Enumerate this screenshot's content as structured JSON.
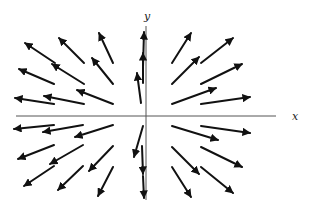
{
  "figure": {
    "title": "",
    "axes": {
      "x": {
        "label": "x",
        "from": [
          16,
          116
        ],
        "to": [
          276,
          116
        ],
        "label_pos": [
          292,
          120
        ],
        "color": "#555555"
      },
      "y": {
        "label": "y",
        "from": [
          146,
          200
        ],
        "to": [
          146,
          26
        ],
        "label_pos": [
          144,
          20
        ],
        "color": "#555555"
      }
    },
    "arrow_color": "#111111",
    "arrows": [
      {
        "tail": [
          55,
          63
        ],
        "head": [
          25,
          43
        ]
      },
      {
        "tail": [
          84,
          63
        ],
        "head": [
          59,
          38
        ]
      },
      {
        "tail": [
          113,
          63
        ],
        "head": [
          99,
          33
        ]
      },
      {
        "tail": [
          54,
          84
        ],
        "head": [
          19,
          69
        ]
      },
      {
        "tail": [
          84,
          84
        ],
        "head": [
          52,
          64
        ]
      },
      {
        "tail": [
          113,
          84
        ],
        "head": [
          92,
          58
        ]
      },
      {
        "tail": [
          54,
          104
        ],
        "head": [
          15,
          98
        ]
      },
      {
        "tail": [
          84,
          104
        ],
        "head": [
          44,
          96
        ]
      },
      {
        "tail": [
          113,
          104
        ],
        "head": [
          77,
          90
        ]
      },
      {
        "tail": [
          141,
          103
        ],
        "head": [
          137,
          73
        ]
      },
      {
        "tail": [
          143,
          83
        ],
        "head": [
          143,
          53
        ]
      },
      {
        "tail": [
          143,
          67
        ],
        "head": [
          144,
          32
        ]
      },
      {
        "tail": [
          172,
          63
        ],
        "head": [
          191,
          33
        ]
      },
      {
        "tail": [
          201,
          63
        ],
        "head": [
          233,
          38
        ]
      },
      {
        "tail": [
          172,
          84
        ],
        "head": [
          199,
          57
        ]
      },
      {
        "tail": [
          201,
          84
        ],
        "head": [
          242,
          64
        ]
      },
      {
        "tail": [
          172,
          104
        ],
        "head": [
          216,
          88
        ]
      },
      {
        "tail": [
          201,
          104
        ],
        "head": [
          250,
          97
        ]
      },
      {
        "tail": [
          54,
          125
        ],
        "head": [
          14,
          129
        ]
      },
      {
        "tail": [
          83,
          125
        ],
        "head": [
          43,
          132
        ]
      },
      {
        "tail": [
          113,
          125
        ],
        "head": [
          75,
          137
        ]
      },
      {
        "tail": [
          54,
          145
        ],
        "head": [
          18,
          159
        ]
      },
      {
        "tail": [
          83,
          145
        ],
        "head": [
          50,
          164
        ]
      },
      {
        "tail": [
          113,
          146
        ],
        "head": [
          89,
          171
        ]
      },
      {
        "tail": [
          54,
          166
        ],
        "head": [
          24,
          186
        ]
      },
      {
        "tail": [
          83,
          166
        ],
        "head": [
          58,
          190
        ]
      },
      {
        "tail": [
          113,
          167
        ],
        "head": [
          98,
          196
        ]
      },
      {
        "tail": [
          143,
          126
        ],
        "head": [
          134,
          157
        ]
      },
      {
        "tail": [
          142,
          146
        ],
        "head": [
          143,
          174
        ]
      },
      {
        "tail": [
          143,
          176
        ],
        "head": [
          144,
          198
        ]
      },
      {
        "tail": [
          172,
          126
        ],
        "head": [
          218,
          140
        ]
      },
      {
        "tail": [
          201,
          126
        ],
        "head": [
          250,
          133
        ]
      },
      {
        "tail": [
          172,
          147
        ],
        "head": [
          199,
          174
        ]
      },
      {
        "tail": [
          201,
          147
        ],
        "head": [
          242,
          167
        ]
      },
      {
        "tail": [
          172,
          167
        ],
        "head": [
          191,
          197
        ]
      },
      {
        "tail": [
          201,
          167
        ],
        "head": [
          233,
          193
        ]
      }
    ]
  }
}
